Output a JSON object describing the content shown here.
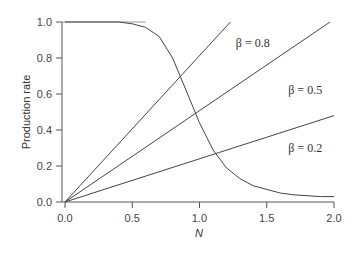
{
  "chart_data": {
    "type": "line",
    "title": "",
    "xlabel": "N",
    "ylabel": "Production rate",
    "xlim": [
      0,
      2.0
    ],
    "ylim": [
      0,
      1.0
    ],
    "xticks": [
      "0.0",
      "0.5",
      "1.0",
      "1.5",
      "2.0"
    ],
    "yticks": [
      "0.0",
      "0.2",
      "0.4",
      "0.6",
      "0.8",
      "1.0"
    ],
    "grid": false,
    "series": [
      {
        "name": "β = 0.8",
        "kind": "linear",
        "slope": 0.8,
        "x": [
          0.0,
          1.23
        ],
        "y": [
          0.0,
          1.0
        ]
      },
      {
        "name": "β = 0.5",
        "kind": "linear",
        "slope": 0.5,
        "x": [
          0.0,
          1.97
        ],
        "y": [
          0.0,
          1.0
        ]
      },
      {
        "name": "β = 0.2",
        "kind": "linear",
        "slope": 0.24,
        "x": [
          0.0,
          2.0
        ],
        "y": [
          0.0,
          0.48
        ]
      },
      {
        "name": "production curve",
        "kind": "sigmoid-decreasing",
        "x": [
          0.0,
          0.2,
          0.4,
          0.5,
          0.6,
          0.7,
          0.8,
          0.9,
          1.0,
          1.1,
          1.2,
          1.3,
          1.4,
          1.5,
          1.6,
          1.7,
          1.8,
          1.9,
          2.0
        ],
        "y": [
          1.0,
          1.0,
          1.0,
          0.99,
          0.97,
          0.92,
          0.8,
          0.62,
          0.44,
          0.29,
          0.19,
          0.13,
          0.09,
          0.07,
          0.05,
          0.04,
          0.035,
          0.03,
          0.03
        ]
      }
    ],
    "annotations": [
      {
        "text": "β = 0.8",
        "x": 1.27,
        "y": 0.86
      },
      {
        "text": "β = 0.5",
        "x": 1.66,
        "y": 0.6
      },
      {
        "text": "β = 0.2",
        "x": 1.66,
        "y": 0.28
      }
    ]
  }
}
